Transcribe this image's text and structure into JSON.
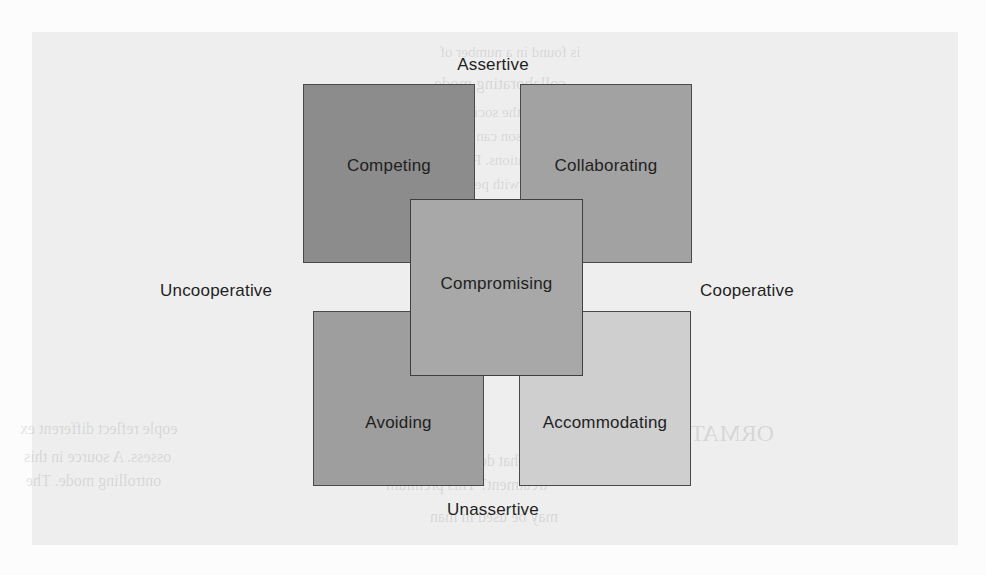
{
  "figure": {
    "axes": {
      "top": "Assertive",
      "bottom": "Unassertive",
      "left": "Uncooperative",
      "right": "Cooperative"
    },
    "boxes": [
      {
        "id": "competing",
        "label": "Competing",
        "fill": "#8c8c8c",
        "border": "#4a4a4a"
      },
      {
        "id": "collaborating",
        "label": "Collaborating",
        "fill": "#a2a2a2",
        "border": "#4a4a4a"
      },
      {
        "id": "compromising",
        "label": "Compromising",
        "fill": "#a8a8a8",
        "border": "#3f3f3f"
      },
      {
        "id": "avoiding",
        "label": "Avoiding",
        "fill": "#9e9e9e",
        "border": "#4a4a4a"
      },
      {
        "id": "accommodating",
        "label": "Accommodating",
        "fill": "#cfcfcf",
        "border": "#4a4a4a"
      }
    ]
  },
  "background": {
    "page_tint": "#eeeeee",
    "ghost_lines": [
      {
        "text": "is found in a number of",
        "x": 440,
        "y": 44,
        "size": 15
      },
      {
        "text": "collaborating mode.",
        "x": 430,
        "y": 74,
        "size": 17
      },
      {
        "text": "with the social style o",
        "x": 420,
        "y": 104,
        "size": 15
      },
      {
        "text": "person can exhibit  all",
        "x": 412,
        "y": 128,
        "size": 15
      },
      {
        "text": "situations. For example",
        "x": 406,
        "y": 152,
        "size": 15
      },
      {
        "text": "with perceived  stat",
        "x": 406,
        "y": 176,
        "size": 15
      },
      {
        "text": "in externally  crucial to",
        "x": 396,
        "y": 200,
        "size": 15
      },
      {
        "text": "relationship is  correct",
        "x": 392,
        "y": 224,
        "size": 15
      },
      {
        "text": "to a comple",
        "x": 470,
        "y": 250,
        "size": 15
      },
      {
        "text": "equally heavy conc",
        "x": 430,
        "y": 292,
        "size": 15
      },
      {
        "text": "avoiding an issue that ar",
        "x": 400,
        "y": 316,
        "size": 15
      },
      {
        "text": "avoiding mode.",
        "x": 446,
        "y": 348,
        "size": 17
      },
      {
        "text": "ORMATION CONTR",
        "x": 560,
        "y": 420,
        "size": 24
      },
      {
        "text": "What do others do with e",
        "x": 372,
        "y": 452,
        "size": 16
      },
      {
        "text": "treatment?  This  premium",
        "x": 386,
        "y": 476,
        "size": 16
      },
      {
        "text": "may be used in man",
        "x": 430,
        "y": 508,
        "size": 16
      },
      {
        "text": "eople reflect different ex",
        "x": 20,
        "y": 420,
        "size": 16
      },
      {
        "text": "ossess. A source in this",
        "x": 24,
        "y": 448,
        "size": 16
      },
      {
        "text": "ontrolling mode. The",
        "x": 26,
        "y": 472,
        "size": 16
      }
    ]
  }
}
